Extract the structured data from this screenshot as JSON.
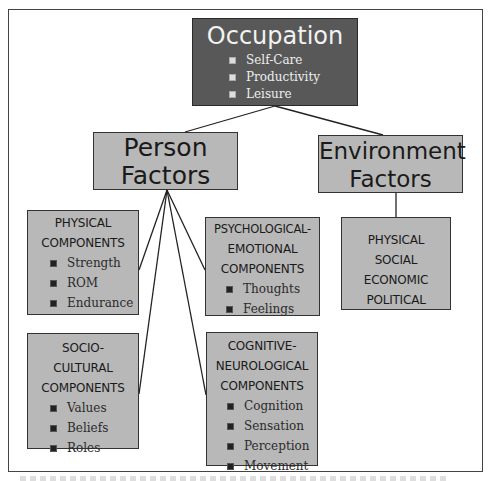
{
  "diagram": {
    "root": {
      "title": "Occupation",
      "items": [
        "Self-Care",
        "Productivity",
        "Leisure"
      ]
    },
    "person": {
      "title_line1": "Person",
      "title_line2": "Factors"
    },
    "environment": {
      "title_line1": "Environment",
      "title_line2": "Factors"
    },
    "physical": {
      "header_line1": "PHYSICAL",
      "header_line2": "COMPONENTS",
      "items": [
        "Strength",
        "ROM",
        "Endurance"
      ]
    },
    "psych": {
      "header_line1": "PSYCHOLOGICAL-",
      "header_line2": "EMOTIONAL",
      "header_line3": "COMPONENTS",
      "items": [
        "Thoughts",
        "Feelings"
      ]
    },
    "socio": {
      "header_line1": "SOCIO-",
      "header_line2": "CULTURAL",
      "header_line3": "COMPONENTS",
      "items": [
        "Values",
        "Beliefs",
        "Roles"
      ]
    },
    "cognitive": {
      "header_line1": "COGNITIVE-",
      "header_line2": "NEUROLOGICAL",
      "header_line3": "COMPONENTS",
      "items": [
        "Cognition",
        "Sensation",
        "Perception",
        "Movement"
      ]
    },
    "env_components": {
      "lines": [
        "PHYSICAL",
        "SOCIAL",
        "ECONOMIC",
        "POLITICAL"
      ]
    }
  },
  "colors": {
    "root_fill": "#585858",
    "box_fill": "#b8b8b8",
    "border": "#333333"
  }
}
